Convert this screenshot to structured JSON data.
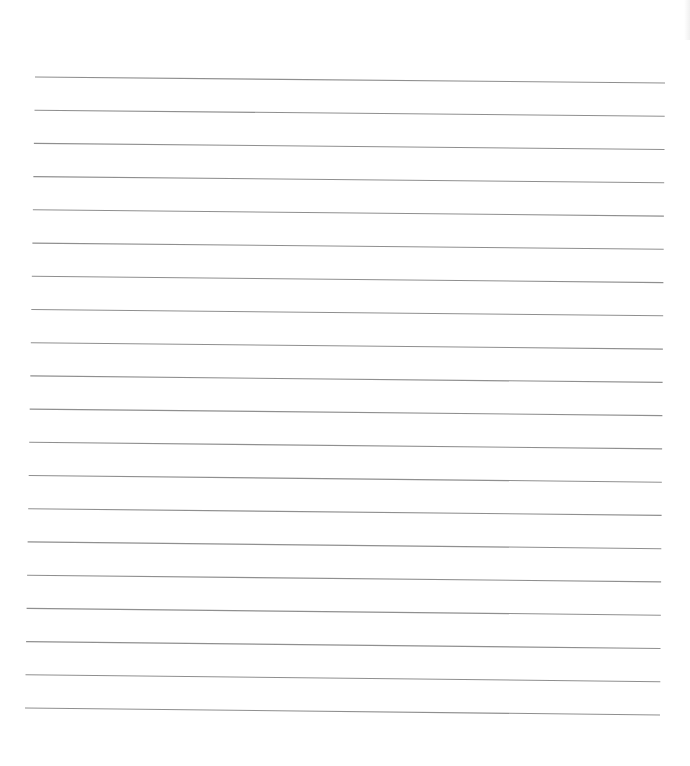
{
  "document": {
    "type": "lined-paper",
    "background_color": "#ffffff",
    "line_color": "#8f8f8f",
    "line_count": 20,
    "first_line": {
      "x1": 35,
      "y1": 77,
      "x2": 665,
      "y2": 83
    },
    "last_line": {
      "x1": 25,
      "y1": 708,
      "x2": 660,
      "y2": 715
    },
    "line_spacing": 33.6,
    "text_content": []
  }
}
